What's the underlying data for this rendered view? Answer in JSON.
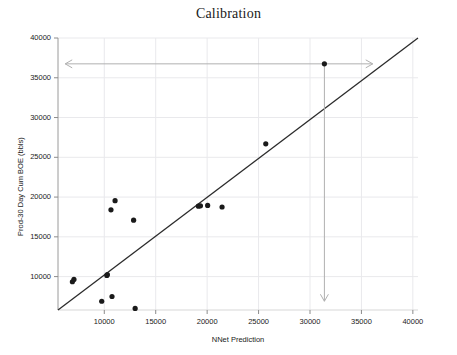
{
  "chart_data": {
    "type": "scatter",
    "title": "Calibration",
    "xlabel": "NNet Prediction",
    "ylabel": "Prod-30 Day Cum BOE (bbls)",
    "xlim": [
      5500,
      40500
    ],
    "ylim": [
      5800,
      40000
    ],
    "xticks": [
      10000,
      15000,
      20000,
      25000,
      30000,
      35000,
      40000
    ],
    "yticks": [
      10000,
      15000,
      20000,
      25000,
      30000,
      35000,
      40000
    ],
    "xtick_labels": [
      "10000",
      "15000",
      "20000",
      "25000",
      "30000",
      "35000",
      "40000"
    ],
    "ytick_labels": [
      "10000",
      "15000",
      "20000",
      "25000",
      "30000",
      "35000",
      "40000"
    ],
    "grid": true,
    "legend": false,
    "series": [
      {
        "name": "Wells",
        "marker": "filled-circle",
        "color": "#1a1a1a",
        "points": [
          {
            "x": 6900,
            "y": 9350
          },
          {
            "x": 7050,
            "y": 9650
          },
          {
            "x": 9750,
            "y": 6900
          },
          {
            "x": 10250,
            "y": 10150
          },
          {
            "x": 10300,
            "y": 10250
          },
          {
            "x": 10750,
            "y": 7500
          },
          {
            "x": 10650,
            "y": 18400
          },
          {
            "x": 11050,
            "y": 19550
          },
          {
            "x": 12850,
            "y": 17100
          },
          {
            "x": 13000,
            "y": 6000
          },
          {
            "x": 19150,
            "y": 18850
          },
          {
            "x": 19350,
            "y": 18900
          },
          {
            "x": 20050,
            "y": 18950
          },
          {
            "x": 21450,
            "y": 18750
          },
          {
            "x": 25700,
            "y": 26700
          },
          {
            "x": 31400,
            "y": 36750
          }
        ]
      }
    ],
    "reference_line": {
      "name": "one-to-one-line",
      "color": "#2b2b2b",
      "from": {
        "x": 5500,
        "y": 5800
      },
      "to": {
        "x": 40500,
        "y": 40000
      }
    },
    "annotations": [
      {
        "name": "horizontal-double-arrow",
        "type": "double-arrow-horizontal",
        "color": "#b0b0b0",
        "y": 36750,
        "x_start": 6200,
        "x_end": 36100
      },
      {
        "name": "vertical-drop-arrow",
        "type": "arrow-down",
        "color": "#b0b0b0",
        "x": 31400,
        "y_start": 36750,
        "y_end": 6900
      }
    ]
  }
}
